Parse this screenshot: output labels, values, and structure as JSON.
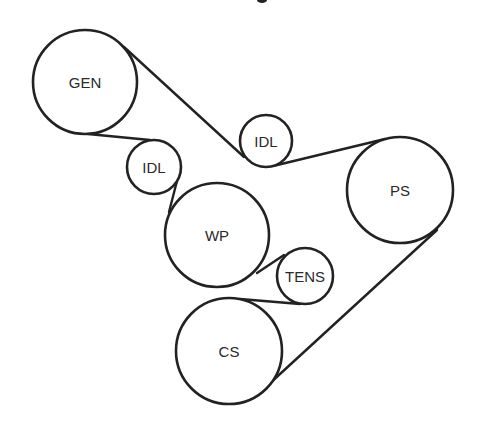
{
  "diagram": {
    "type": "belt-routing",
    "colors": {
      "line": "#222222",
      "background": "#ffffff",
      "text": "#2a2a2a"
    },
    "pulleys": [
      {
        "id": "gen",
        "label": "GEN",
        "cx": 85,
        "cy": 82,
        "r": 52
      },
      {
        "id": "idl1",
        "label": "IDL",
        "cx": 154,
        "cy": 167,
        "r": 27
      },
      {
        "id": "idl2",
        "label": "IDL",
        "cx": 266,
        "cy": 141,
        "r": 26
      },
      {
        "id": "wp",
        "label": "WP",
        "cx": 217,
        "cy": 235,
        "r": 52
      },
      {
        "id": "tens",
        "label": "TENS",
        "cx": 305,
        "cy": 276,
        "r": 28
      },
      {
        "id": "cs",
        "label": "CS",
        "cx": 229,
        "cy": 351,
        "r": 53
      },
      {
        "id": "ps",
        "label": "PS",
        "cx": 400,
        "cy": 190,
        "r": 53
      }
    ],
    "belt_segments": [
      {
        "from": "gen",
        "to": "idl2",
        "x1": 124,
        "y1": 47,
        "x2": 244,
        "y2": 157
      },
      {
        "from": "idl2",
        "to": "ps",
        "x1": 273,
        "y1": 166,
        "x2": 385,
        "y2": 139
      },
      {
        "from": "ps",
        "to": "cs",
        "x1": 437,
        "y1": 230,
        "x2": 268,
        "y2": 385
      },
      {
        "from": "cs",
        "to": "tens",
        "x1": 240,
        "y1": 299,
        "x2": 300,
        "y2": 304
      },
      {
        "from": "tens",
        "to": "wp",
        "x1": 284,
        "y1": 255,
        "x2": 257,
        "y2": 273
      },
      {
        "from": "wp",
        "to": "idl1",
        "x1": 169,
        "y1": 212,
        "x2": 177,
        "y2": 181
      },
      {
        "from": "idl1",
        "to": "gen",
        "x1": 150,
        "y1": 140,
        "x2": 88,
        "y2": 134
      }
    ]
  }
}
